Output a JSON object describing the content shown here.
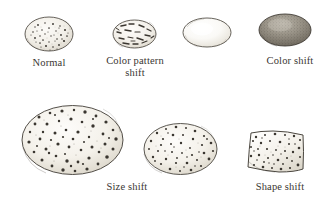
{
  "figure": {
    "background_color": "#ffffff",
    "ink_color": "#3a3632",
    "shell_fill": "#f6f4ef"
  },
  "specimens": [
    {
      "id": "normal",
      "label": "Normal",
      "shape": "oval",
      "marking": "fine speckles",
      "marking_count": 46,
      "relative_size": "standard",
      "shade": "light",
      "x": 24,
      "y": 16,
      "w": 50,
      "h": 36,
      "caption_x": 12,
      "caption_y": 57,
      "caption_w": 74
    },
    {
      "id": "color-pattern-shift",
      "label": "Color pattern\nshift",
      "shape": "oval",
      "marking": "dashes and streaks",
      "marking_count": 17,
      "relative_size": "standard",
      "shade": "light",
      "x": 112,
      "y": 19,
      "w": 45,
      "h": 30,
      "caption_x": 100,
      "caption_y": 55,
      "caption_w": 70
    },
    {
      "id": "color-shift-pale",
      "label": "",
      "shape": "oval",
      "marking": "none",
      "marking_count": 0,
      "relative_size": "standard",
      "shade": "very light",
      "x": 182,
      "y": 17,
      "w": 50,
      "h": 31,
      "caption_x": 0,
      "caption_y": 0,
      "caption_w": 0
    },
    {
      "id": "color-shift",
      "label": "Color shift",
      "shape": "oval",
      "marking": "none",
      "marking_count": 0,
      "relative_size": "standard",
      "shade": "dark",
      "x": 258,
      "y": 13,
      "w": 54,
      "h": 34,
      "caption_x": 251,
      "caption_y": 55,
      "caption_w": 78
    },
    {
      "id": "size-shift-large",
      "label": "Size shift",
      "shape": "oval",
      "marking": "coarse speckles",
      "marking_count": 58,
      "relative_size": "large",
      "shade": "light",
      "x": 21,
      "y": 104,
      "w": 103,
      "h": 72,
      "caption_x": 88,
      "caption_y": 181,
      "caption_w": 78
    },
    {
      "id": "size-shift-medium",
      "label": "",
      "shape": "oval",
      "marking": "coarse speckles",
      "marking_count": 46,
      "relative_size": "medium",
      "shade": "light",
      "x": 143,
      "y": 122,
      "w": 75,
      "h": 54,
      "caption_x": 0,
      "caption_y": 0,
      "caption_w": 0
    },
    {
      "id": "shape-shift",
      "label": "Shape shift",
      "shape": "rounded-rectangle",
      "marking": "coarse speckles",
      "marking_count": 42,
      "relative_size": "standard",
      "shade": "light",
      "x": 245,
      "y": 127,
      "w": 62,
      "h": 50,
      "caption_x": 238,
      "caption_y": 181,
      "caption_w": 84
    }
  ]
}
